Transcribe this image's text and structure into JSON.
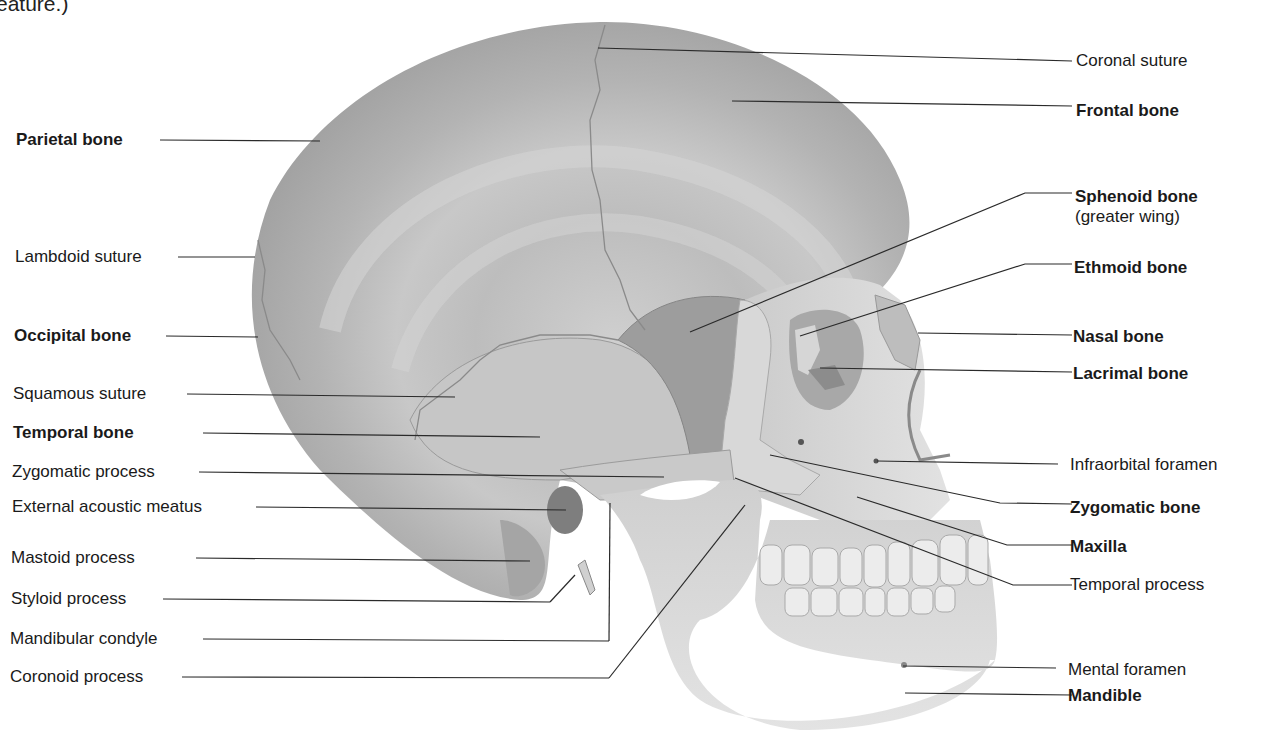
{
  "caption_fragment": "eature.)",
  "colors": {
    "background": "#ffffff",
    "bone_base": "#b9b9b9",
    "bone_light": "#dcdcdc",
    "bone_dark": "#8f8f8f",
    "leader_line": "#2a2a2a",
    "text": "#1a1a1a"
  },
  "labels_left": [
    {
      "id": "parietal-bone",
      "text": "Parietal bone",
      "bold": true
    },
    {
      "id": "lambdoid-suture",
      "text": "Lambdoid suture",
      "bold": false
    },
    {
      "id": "occipital-bone",
      "text": "Occipital bone",
      "bold": true
    },
    {
      "id": "squamous-suture",
      "text": "Squamous suture",
      "bold": false
    },
    {
      "id": "temporal-bone",
      "text": "Temporal bone",
      "bold": true
    },
    {
      "id": "zygomatic-process",
      "text": "Zygomatic process",
      "bold": false
    },
    {
      "id": "external-acoustic-meatus",
      "text": "External acoustic meatus",
      "bold": false
    },
    {
      "id": "mastoid-process",
      "text": "Mastoid process",
      "bold": false
    },
    {
      "id": "styloid-process",
      "text": "Styloid process",
      "bold": false
    },
    {
      "id": "mandibular-condyle",
      "text": "Mandibular condyle",
      "bold": false
    },
    {
      "id": "coronoid-process",
      "text": "Coronoid process",
      "bold": false
    }
  ],
  "labels_right": [
    {
      "id": "coronal-suture",
      "text": "Coronal suture",
      "bold": false
    },
    {
      "id": "frontal-bone",
      "text": "Frontal bone",
      "bold": true
    },
    {
      "id": "sphenoid-bone",
      "text": "Sphenoid bone",
      "sub": "(greater wing)",
      "bold": true
    },
    {
      "id": "ethmoid-bone",
      "text": "Ethmoid bone",
      "bold": true
    },
    {
      "id": "nasal-bone",
      "text": "Nasal bone",
      "bold": true
    },
    {
      "id": "lacrimal-bone",
      "text": "Lacrimal bone",
      "bold": true
    },
    {
      "id": "infraorbital-foramen",
      "text": "Infraorbital foramen",
      "bold": false
    },
    {
      "id": "zygomatic-bone",
      "text": "Zygomatic bone",
      "bold": true
    },
    {
      "id": "maxilla",
      "text": "Maxilla",
      "bold": true
    },
    {
      "id": "temporal-process",
      "text": "Temporal process",
      "bold": false
    },
    {
      "id": "mental-foramen",
      "text": "Mental foramen",
      "bold": false
    },
    {
      "id": "mandible",
      "text": "Mandible",
      "bold": true
    }
  ]
}
